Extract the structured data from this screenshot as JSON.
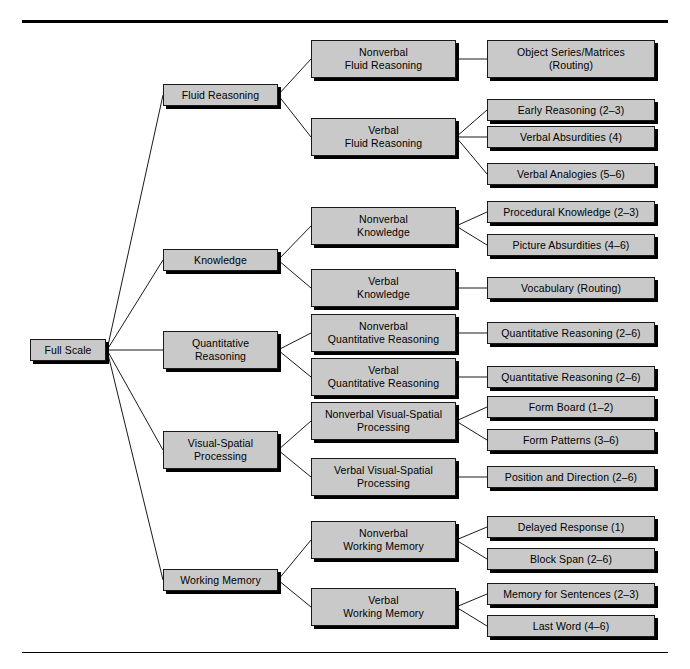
{
  "diagram": {
    "type": "hierarchical-tree",
    "title": "",
    "orientation": "left-to-right",
    "levels": [
      "Full Scale",
      "Domain",
      "Nonverbal/Verbal Factor",
      "Subtest (Levels)"
    ],
    "style": {
      "box_fill": "#c9c9c9",
      "box_border": "#1a1a1a",
      "box_shadow": "#000000",
      "line_color": "#1a1a1a",
      "background": "#ffffff",
      "rule_color": "#000000"
    },
    "root": {
      "label": "Full Scale"
    },
    "domains": [
      {
        "label": "Fluid Reasoning"
      },
      {
        "label": "Knowledge"
      },
      {
        "label": "Quantitative\nReasoning"
      },
      {
        "label": "Visual-Spatial\nProcessing"
      },
      {
        "label": "Working Memory"
      }
    ],
    "factors": [
      {
        "label": "Nonverbal\nFluid Reasoning"
      },
      {
        "label": "Verbal\nFluid Reasoning"
      },
      {
        "label": "Nonverbal\nKnowledge"
      },
      {
        "label": "Verbal\nKnowledge"
      },
      {
        "label": "Nonverbal\nQuantitative Reasoning"
      },
      {
        "label": "Verbal\nQuantitative Reasoning"
      },
      {
        "label": "Nonverbal Visual-Spatial\nProcessing"
      },
      {
        "label": "Verbal Visual-Spatial\nProcessing"
      },
      {
        "label": "Nonverbal\nWorking Memory"
      },
      {
        "label": "Verbal\nWorking Memory"
      }
    ],
    "subtests": [
      {
        "label": "Object Series/Matrices\n(Routing)"
      },
      {
        "label": "Early Reasoning (2–3)"
      },
      {
        "label": "Verbal Absurdities (4)"
      },
      {
        "label": "Verbal Analogies (5–6)"
      },
      {
        "label": "Procedural Knowledge (2–3)"
      },
      {
        "label": "Picture Absurdities (4–6)"
      },
      {
        "label": "Vocabulary (Routing)"
      },
      {
        "label": "Quantitative Reasoning (2–6)"
      },
      {
        "label": "Quantitative Reasoning (2–6)"
      },
      {
        "label": "Form Board (1–2)"
      },
      {
        "label": "Form Patterns (3–6)"
      },
      {
        "label": "Position and Direction (2–6)"
      },
      {
        "label": "Delayed Response (1)"
      },
      {
        "label": "Block Span (2–6)"
      },
      {
        "label": "Memory for Sentences (2–3)"
      },
      {
        "label": "Last Word (4–6)"
      }
    ]
  }
}
